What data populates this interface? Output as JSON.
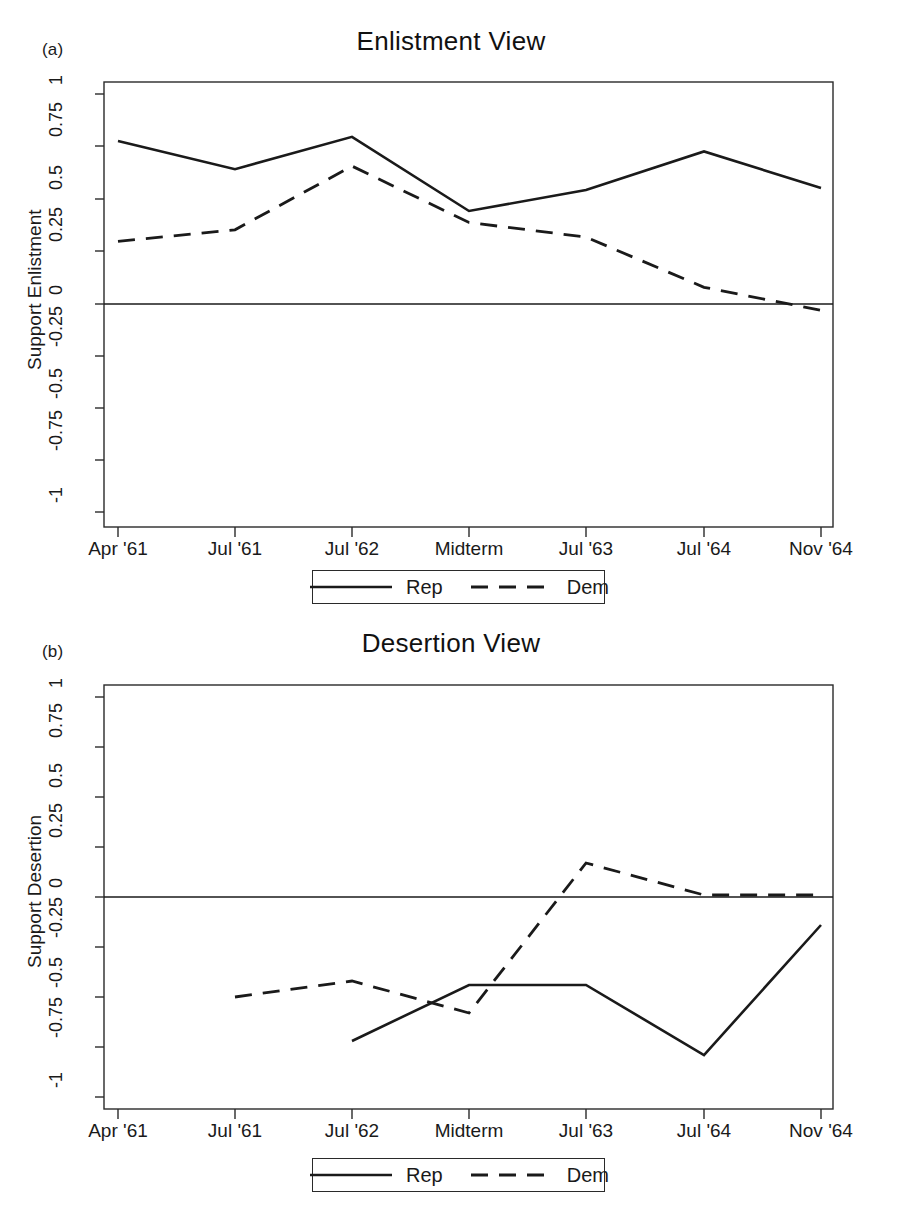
{
  "figure": {
    "panels": [
      {
        "tag": "(a)",
        "title": "Enlistment View",
        "ylabel": "Support Enlistment"
      },
      {
        "tag": "(b)",
        "title": "Desertion View",
        "ylabel": "Support Desertion"
      }
    ],
    "legend": {
      "entries": [
        {
          "label": "Rep",
          "style": "solid"
        },
        {
          "label": "Dem",
          "style": "dashed"
        }
      ]
    },
    "colors": {
      "line": "#1a1a1a",
      "axis": "#2a2a2a",
      "background": "#ffffff"
    }
  },
  "chart_data": [
    {
      "type": "line",
      "title": "Enlistment View",
      "panel_tag": "(a)",
      "xlabel": "",
      "ylabel": "Support Enlistment",
      "categories": [
        "Apr '61",
        "Jul '61",
        "Jul '62",
        "Midterm",
        "Jul '63",
        "Jul '64",
        "Nov '64"
      ],
      "ytick_labels": [
        "1",
        "0.75",
        "0.5",
        "0.25",
        "0",
        "-0.25",
        "-0.5",
        "-0.75",
        "-1"
      ],
      "yticks": [
        1,
        0.75,
        0.5,
        0.25,
        0,
        -0.25,
        -0.5,
        -0.75,
        -1
      ],
      "ylim": [
        -1.06,
        1.06
      ],
      "grid": false,
      "zero_line": true,
      "legend_position": "below",
      "series": [
        {
          "name": "Rep",
          "style": "solid",
          "values": [
            0.78,
            0.645,
            0.8,
            0.445,
            0.545,
            0.73,
            0.555
          ]
        },
        {
          "name": "Dem",
          "style": "dashed",
          "values": [
            0.3,
            0.355,
            0.66,
            0.39,
            0.32,
            0.08,
            -0.03
          ]
        }
      ]
    },
    {
      "type": "line",
      "title": "Desertion View",
      "panel_tag": "(b)",
      "xlabel": "",
      "ylabel": "Support Desertion",
      "categories": [
        "Apr '61",
        "Jul '61",
        "Jul '62",
        "Midterm",
        "Jul '63",
        "Jul '64",
        "Nov '64"
      ],
      "ytick_labels": [
        "1",
        "0.75",
        "0.5",
        "0.25",
        "0",
        "-0.25",
        "-0.5",
        "-0.75",
        "-1"
      ],
      "yticks": [
        1,
        0.75,
        0.5,
        0.25,
        0,
        -0.25,
        -0.5,
        -0.75,
        -1
      ],
      "ylim": [
        -1.06,
        1.06
      ],
      "grid": false,
      "zero_line": true,
      "legend_position": "below",
      "series": [
        {
          "name": "Rep",
          "style": "solid",
          "values": [
            null,
            null,
            -0.72,
            -0.44,
            -0.44,
            -0.79,
            -0.14
          ]
        },
        {
          "name": "Dem",
          "style": "dashed",
          "values": [
            null,
            -0.5,
            -0.42,
            -0.58,
            0.17,
            0.01,
            0.01
          ]
        }
      ]
    }
  ]
}
